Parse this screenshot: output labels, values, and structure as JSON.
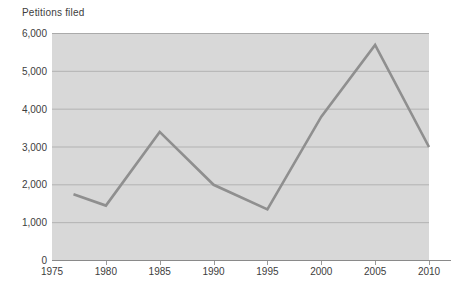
{
  "title": "Petitions filed",
  "colors": {
    "plot_background": "#d8d8d8",
    "gridline": "#b2b2b2",
    "top_gridline": "#aaaaaa",
    "axis_line": "#8a8a8a",
    "tick": "#9a9a9a",
    "series_line": "#8f8f8f",
    "text": "#3d3d3d"
  },
  "chart_data": {
    "type": "line",
    "title": "Petitions filed",
    "x": [
      1977,
      1980,
      1985,
      1990,
      1995,
      2000,
      2005,
      2010
    ],
    "values": [
      1750,
      1450,
      3400,
      2000,
      1350,
      3800,
      5700,
      3000
    ],
    "series_name": "Petitions filed",
    "xlabel": "",
    "ylabel": "Petitions filed",
    "xlim": [
      1975,
      2010
    ],
    "ylim": [
      0,
      6000
    ],
    "x_tick_values": [
      1975,
      1980,
      1985,
      1990,
      1995,
      2000,
      2005,
      2010
    ],
    "x_tick_labels": [
      "1975",
      "1980",
      "1985",
      "1990",
      "1995",
      "2000",
      "2005",
      "2010"
    ],
    "y_tick_values": [
      0,
      1000,
      2000,
      3000,
      4000,
      5000,
      6000
    ],
    "y_tick_labels": [
      "0",
      "1,000",
      "2,000",
      "3,000",
      "4,000",
      "5,000",
      "6,000"
    ],
    "grid": true,
    "legend": false
  }
}
